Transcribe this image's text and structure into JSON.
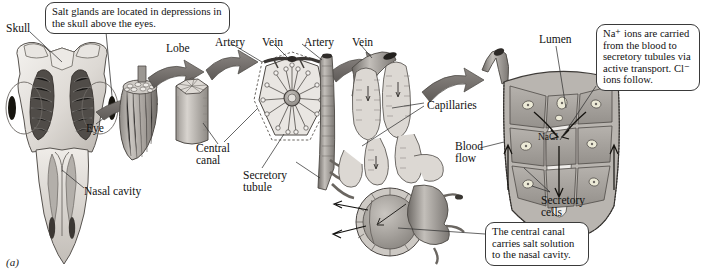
{
  "figure": {
    "marker": "(a)",
    "background": "#ffffff",
    "ink": "#1a1a1a"
  },
  "callouts": [
    {
      "id": "salt-glands-location",
      "lines": [
        "Salt glands are located in depressions",
        "in the skull above the eyes."
      ],
      "x": 45,
      "y": 2,
      "w": 185,
      "h": 30,
      "leader_to": {
        "x": 112,
        "y": 96
      }
    },
    {
      "id": "sodium-transport",
      "lines": [
        "Na⁺ ions are carried",
        "from the blood to",
        "secretory tubules via",
        "active transport. Cl⁻",
        "ions follow."
      ],
      "x": 596,
      "y": 24,
      "w": 104,
      "h": 62,
      "leader_to": {
        "x": 560,
        "y": 118
      }
    },
    {
      "id": "central-canal-function",
      "lines": [
        "The central canal",
        "carries salt solution",
        "to the nasal cavity."
      ],
      "x": 485,
      "y": 222,
      "w": 104,
      "h": 42,
      "leader_to": {
        "x": 425,
        "y": 232
      }
    }
  ],
  "labels": [
    {
      "id": "skull",
      "text": "Skull",
      "x": 6,
      "y": 22,
      "align": "left"
    },
    {
      "id": "eye",
      "text": "Eye",
      "x": 86,
      "y": 122,
      "align": "left"
    },
    {
      "id": "nasal-cavity",
      "text": "Nasal cavity",
      "x": 84,
      "y": 185,
      "align": "left"
    },
    {
      "id": "lobe",
      "text": "Lobe",
      "x": 166,
      "y": 42,
      "align": "left"
    },
    {
      "id": "artery-1",
      "text": "Artery",
      "x": 215,
      "y": 36,
      "align": "left"
    },
    {
      "id": "vein-1",
      "text": "Vein",
      "x": 262,
      "y": 36,
      "align": "left"
    },
    {
      "id": "artery-2",
      "text": "Artery",
      "x": 304,
      "y": 36,
      "align": "left"
    },
    {
      "id": "vein-2",
      "text": "Vein",
      "x": 352,
      "y": 36,
      "align": "left"
    },
    {
      "id": "central-canal",
      "text": "Central\ncanal",
      "x": 196,
      "y": 142,
      "align": "left"
    },
    {
      "id": "secretory-tubule",
      "text": "Secretory\ntubule",
      "x": 243,
      "y": 169,
      "align": "left"
    },
    {
      "id": "capillaries",
      "text": "Capillaries",
      "x": 427,
      "y": 99,
      "align": "left"
    },
    {
      "id": "blood-flow",
      "text": "Blood\nflow",
      "x": 455,
      "y": 140,
      "align": "left"
    },
    {
      "id": "lumen",
      "text": "Lumen",
      "x": 539,
      "y": 33,
      "align": "left"
    },
    {
      "id": "secretory-cells",
      "text": "Secretory\ncells",
      "x": 541,
      "y": 194,
      "align": "left"
    },
    {
      "id": "nacl",
      "text": "NaCl",
      "x": 538,
      "y": 132,
      "align": "left"
    }
  ],
  "stages": [
    {
      "id": "stage-skull",
      "name": "Bird skull with salt glands"
    },
    {
      "id": "stage-gland",
      "name": "Whole salt gland showing lobes"
    },
    {
      "id": "stage-lobe",
      "name": "Single lobe cylinder"
    },
    {
      "id": "stage-lobe-cross",
      "name": "Lobe cross section with radiating tubules"
    },
    {
      "id": "stage-tubule-network",
      "name": "Secretory tubules and central canal"
    },
    {
      "id": "stage-tubule-detail",
      "name": "Secretory tubule cellular detail"
    }
  ]
}
